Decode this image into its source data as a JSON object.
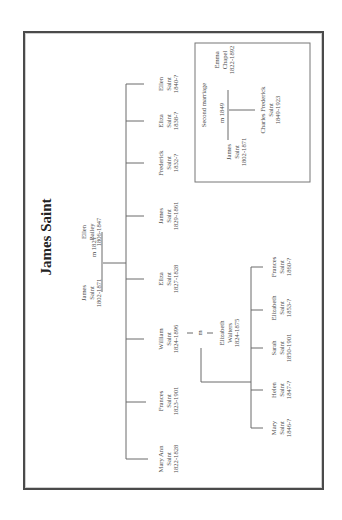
{
  "title": "James Saint",
  "parents": {
    "father": {
      "name": "James",
      "surname": "Saint",
      "dates": "1802-1871"
    },
    "marriage": "m 1821",
    "mother": {
      "name": "Ellen",
      "surname": "Bailey",
      "dates": "1806-1847"
    }
  },
  "children": [
    {
      "name": "Mary Ann",
      "surname": "Saint",
      "dates": "1822-1828"
    },
    {
      "name": "Frances",
      "surname": "Saint",
      "dates": "1823-1901"
    },
    {
      "name": "William",
      "surname": "Saint",
      "dates": "1824-1896"
    },
    {
      "name": "Eliza",
      "surname": "Saint",
      "dates": "1827-1828"
    },
    {
      "name": "James",
      "surname": "Saint",
      "dates": "1829-1861"
    },
    {
      "name": "Frederick",
      "surname": "Saint",
      "dates": "1832-?"
    },
    {
      "name": "Eliza",
      "surname": "Saint",
      "dates": "1838-?"
    },
    {
      "name": "Ellen",
      "surname": "Saint",
      "dates": "1840-?"
    }
  ],
  "william_marriage": {
    "marker": "m",
    "spouse": {
      "name": "Elizabeth",
      "surname": "Walters",
      "dates": "1824-1875"
    }
  },
  "grandchildren": [
    {
      "name": "Mary",
      "surname": "Saint",
      "dates": "1846-?"
    },
    {
      "name": "Helen",
      "surname": "Saint",
      "dates": "1847-?"
    },
    {
      "name": "Sarah",
      "surname": "Saint",
      "dates": "1850-1901"
    },
    {
      "name": "Elizabeth",
      "surname": "Saint",
      "dates": "1853-?"
    },
    {
      "name": "Frances",
      "surname": "Saint",
      "dates": "1860-?"
    }
  ],
  "second_marriage": {
    "heading": "Second marriage",
    "husband": {
      "name": "James",
      "surname": "Saint",
      "dates": "1802-1871"
    },
    "marriage": "m 1849",
    "wife": {
      "name": "Emma",
      "surname": "Chapel",
      "dates": "1822-1892"
    },
    "child": {
      "name": "Charles Frederick",
      "surname": "Saint",
      "dates": "1849-1923"
    }
  }
}
